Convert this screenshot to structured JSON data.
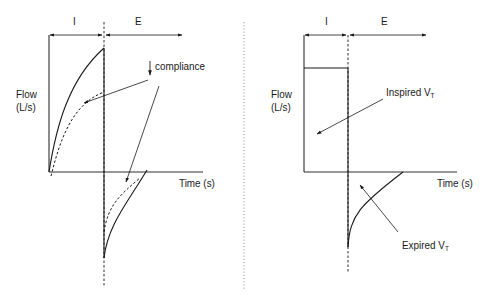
{
  "figure": {
    "divider": "dotted vertical separator between panels"
  },
  "left_panel": {
    "phase_labels": {
      "inspiration": "I",
      "expiration": "E"
    },
    "y_axis_label_line1": "Flow",
    "y_axis_label_line2": "(L/s)",
    "x_axis_label": "Time (s)",
    "annotation": {
      "arrow_glyph": "↓",
      "text": "compliance"
    },
    "curves": [
      {
        "name": "inspiratory-flow-normal",
        "style": "solid"
      },
      {
        "name": "inspiratory-flow-decreased-compliance",
        "style": "dashed"
      },
      {
        "name": "expiratory-flow-normal",
        "style": "solid"
      },
      {
        "name": "expiratory-flow-decreased-compliance",
        "style": "dashed"
      }
    ]
  },
  "right_panel": {
    "phase_labels": {
      "inspiration": "I",
      "expiration": "E"
    },
    "y_axis_label_line1": "Flow",
    "y_axis_label_line2": "(L/s)",
    "x_axis_label": "Time (s)",
    "inspired_label": {
      "text": "Inspired V",
      "subscript": "T"
    },
    "expired_label": {
      "text": "Expired V",
      "subscript": "T"
    },
    "curves": [
      {
        "name": "constant-inspiratory-flow",
        "style": "solid"
      },
      {
        "name": "expiratory-flow-decay",
        "style": "solid"
      }
    ]
  },
  "colors": {
    "line": "#1a1a1a",
    "divider": "#9a9a9a",
    "background": "#ffffff"
  }
}
